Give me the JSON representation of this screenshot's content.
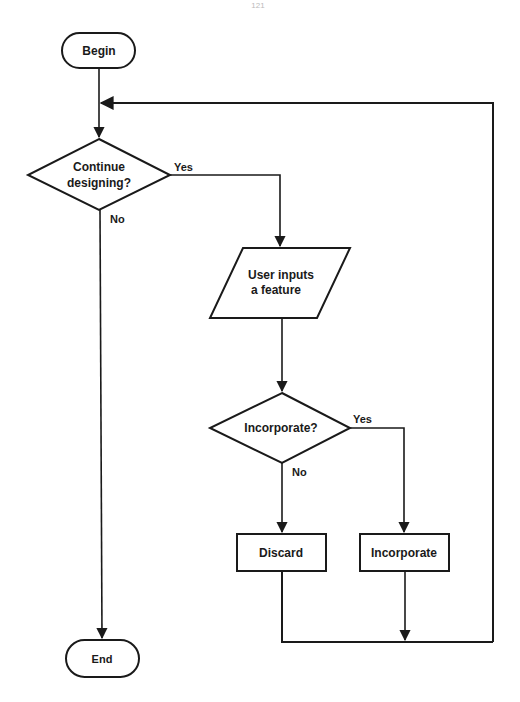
{
  "page": {
    "number": "121"
  },
  "flowchart": {
    "nodes": {
      "begin": {
        "type": "terminal",
        "label": "Begin"
      },
      "continue": {
        "type": "decision",
        "lines": [
          "Continue",
          "designing?"
        ]
      },
      "input": {
        "type": "io",
        "lines": [
          "User inputs",
          "a feature"
        ]
      },
      "incorporateQ": {
        "type": "decision",
        "label": "Incorporate?"
      },
      "discard": {
        "type": "process",
        "label": "Discard"
      },
      "incorporate": {
        "type": "process",
        "label": "Incorporate"
      },
      "end": {
        "type": "terminal",
        "label": "End"
      }
    },
    "edges": {
      "continue_yes": "Yes",
      "continue_no": "No",
      "incorporate_yes": "Yes",
      "incorporate_no": "No"
    },
    "colors": {
      "stroke": "#1a1a1a",
      "background": "#ffffff"
    }
  }
}
